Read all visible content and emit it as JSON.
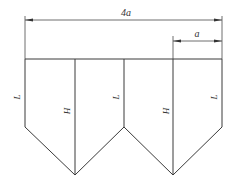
{
  "diagram": {
    "dimensions": {
      "total_width": "4a",
      "panel_width": "a"
    },
    "labels": {
      "left_edge": "L",
      "fold_1": "H",
      "middle_edge": "L",
      "fold_2": "H",
      "right_edge": "L"
    },
    "colors": {
      "line": "#3a3a3a",
      "background": "#ffffff"
    }
  }
}
